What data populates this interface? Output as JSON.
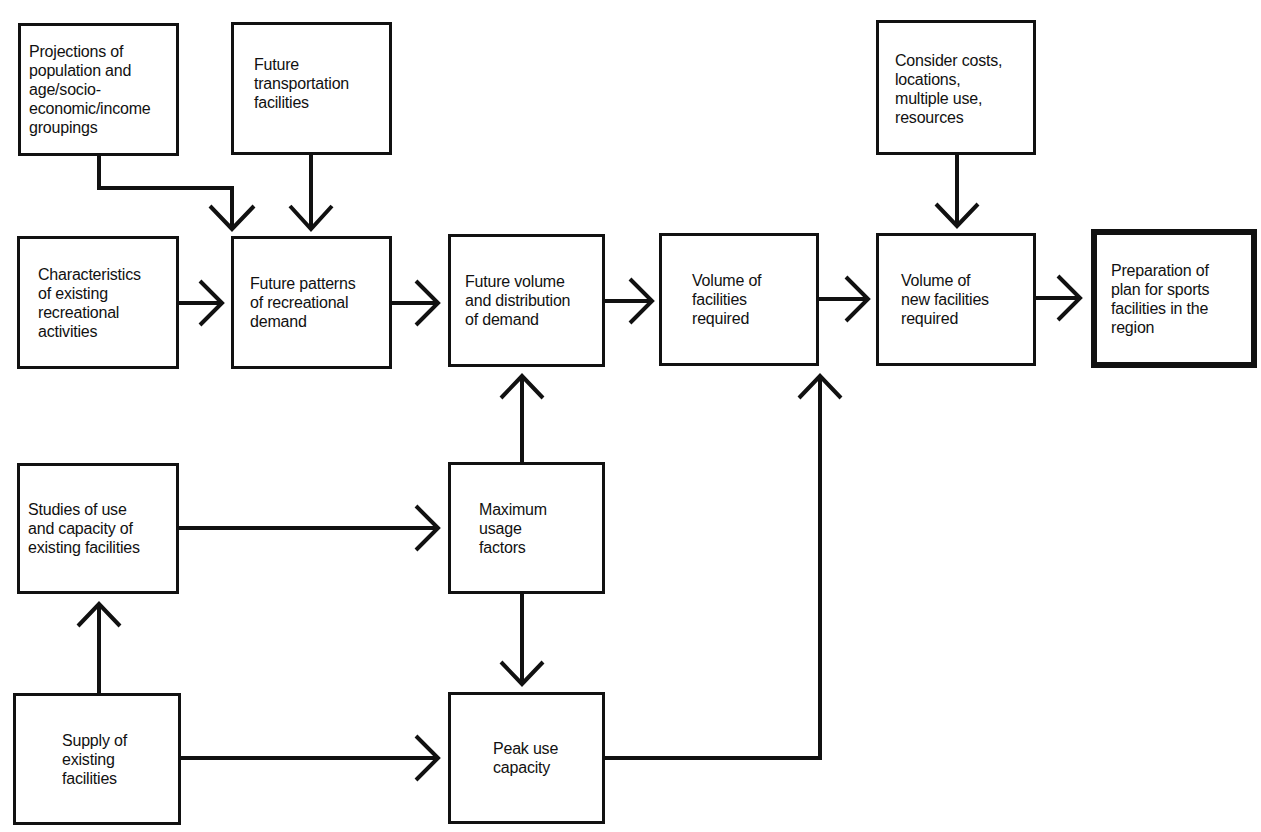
{
  "diagram": {
    "title": "",
    "nodes": [
      {
        "id": "projections",
        "text": "Projections of population and age/socio-economic/income groupings"
      },
      {
        "id": "transport",
        "text": "Future transportation facilities"
      },
      {
        "id": "characteristics",
        "text": "Characteristics of existing recreational activities"
      },
      {
        "id": "future_patterns",
        "text": "Future patterns of recreational demand"
      },
      {
        "id": "future_volume",
        "text": "Future volume and distribution of demand"
      },
      {
        "id": "volume_facilities",
        "text": "Volume of facilities required"
      },
      {
        "id": "consider_costs",
        "text": "Consider costs, locations, multiple use, resources"
      },
      {
        "id": "volume_new",
        "text": "Volume of new facilities required"
      },
      {
        "id": "preparation",
        "text": "Preparation of plan for sports facilities in the region"
      },
      {
        "id": "studies",
        "text": "Studies of use and capacity of existing facilities"
      },
      {
        "id": "max_usage",
        "text": "Maximum usage factors"
      },
      {
        "id": "supply",
        "text": "Supply of existing facilities"
      },
      {
        "id": "peak_use",
        "text": "Peak use capacity"
      }
    ],
    "edges": [
      {
        "from": "projections",
        "to": "future_patterns"
      },
      {
        "from": "transport",
        "to": "future_patterns"
      },
      {
        "from": "characteristics",
        "to": "future_patterns"
      },
      {
        "from": "future_patterns",
        "to": "future_volume"
      },
      {
        "from": "future_volume",
        "to": "volume_facilities"
      },
      {
        "from": "volume_facilities",
        "to": "volume_new"
      },
      {
        "from": "consider_costs",
        "to": "volume_new"
      },
      {
        "from": "volume_new",
        "to": "preparation"
      },
      {
        "from": "studies",
        "to": "max_usage"
      },
      {
        "from": "max_usage",
        "to": "future_volume"
      },
      {
        "from": "max_usage",
        "to": "peak_use"
      },
      {
        "from": "supply",
        "to": "studies"
      },
      {
        "from": "supply",
        "to": "peak_use"
      },
      {
        "from": "peak_use",
        "to": "volume_facilities"
      }
    ]
  },
  "labels": {
    "projections": [
      "Projections of",
      "population and",
      "age/socio-",
      "economic/income",
      "groupings"
    ],
    "transport": [
      "Future",
      "transportation",
      "facilities"
    ],
    "characteristics": [
      "Characteristics",
      "of existing",
      "recreational",
      "activities"
    ],
    "future_patterns": [
      "Future patterns",
      "of recreational",
      "demand"
    ],
    "future_volume": [
      "Future volume",
      "and distribution",
      "of demand"
    ],
    "volume_facilities": [
      "Volume of",
      "facilities",
      "required"
    ],
    "consider_costs": [
      "Consider costs,",
      "locations,",
      "multiple use,",
      "resources"
    ],
    "volume_new": [
      "Volume of",
      "new facilities",
      "required"
    ],
    "preparation": [
      "Preparation of",
      "plan for sports",
      "facilities in the",
      "region"
    ],
    "studies": [
      "Studies of use",
      "and capacity of",
      "existing facilities"
    ],
    "max_usage": [
      "Maximum",
      "usage",
      "factors"
    ],
    "supply": [
      "Supply of",
      "existing",
      "facilities"
    ],
    "peak_use": [
      "Peak use",
      "capacity"
    ]
  }
}
